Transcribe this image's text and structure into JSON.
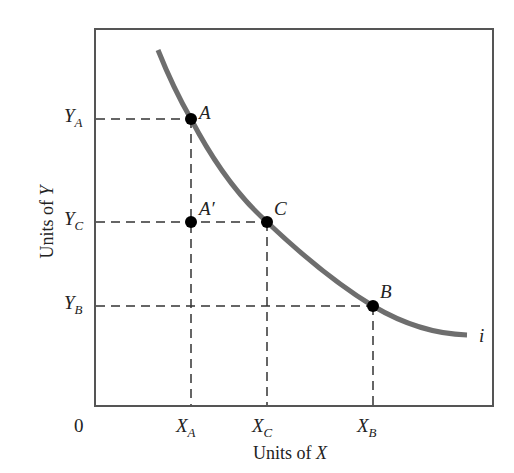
{
  "diagram": {
    "type": "indifference-curve",
    "axes": {
      "x_title_prefix": "Units of ",
      "x_title_var": "X",
      "y_title_prefix": "Units of ",
      "y_title_var": "Y",
      "origin_label": "0"
    },
    "x_ticks": [
      {
        "main": "X",
        "sub": "A"
      },
      {
        "main": "X",
        "sub": "C"
      },
      {
        "main": "X",
        "sub": "B"
      }
    ],
    "y_ticks": [
      {
        "main": "Y",
        "sub": "A"
      },
      {
        "main": "Y",
        "sub": "C"
      },
      {
        "main": "Y",
        "sub": "B"
      }
    ],
    "points": [
      {
        "label": "A",
        "x": "X_A",
        "y": "Y_A",
        "on_curve": true
      },
      {
        "label": "A′",
        "x": "X_A",
        "y": "Y_C",
        "on_curve": false
      },
      {
        "label": "C",
        "x": "X_C",
        "y": "Y_C",
        "on_curve": true
      },
      {
        "label": "B",
        "x": "X_B",
        "y": "Y_B",
        "on_curve": true
      }
    ],
    "curve": {
      "label": "i",
      "color": "#6e6e6e"
    },
    "colors": {
      "frame": "#555555",
      "dash": "#333333",
      "point": "#000000"
    }
  }
}
